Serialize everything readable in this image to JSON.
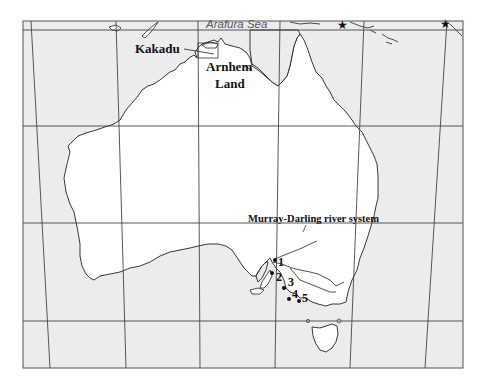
{
  "map": {
    "title": "Map of Australia",
    "colors": {
      "ocean": "#ececec",
      "land": "#ffffff",
      "coastline": "#222222",
      "grid": "#444444",
      "frame": "#555555",
      "text": "#111111",
      "sea_label": "#555555"
    },
    "labels": {
      "sea": "Arafura Sea",
      "kakadu": "Kakadu",
      "arnhem_line1": "Arnhem",
      "arnhem_line2": "Land",
      "murray_darling": "Murray-Darling river system"
    },
    "sites": [
      {
        "id": "1",
        "label": "1"
      },
      {
        "id": "2",
        "label": "2"
      },
      {
        "id": "3",
        "label": "3"
      },
      {
        "id": "4",
        "label": "4"
      },
      {
        "id": "5",
        "label": "5"
      }
    ],
    "markers": [
      {
        "type": "star",
        "name": "star-marker-1"
      },
      {
        "type": "star",
        "name": "star-marker-2"
      }
    ]
  }
}
